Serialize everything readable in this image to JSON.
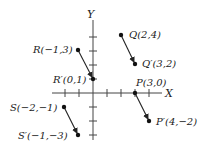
{
  "diagram": {
    "axes": {
      "x_label": "X",
      "y_label": "Y",
      "origin_px": [
        93,
        93
      ],
      "unit_px": 14,
      "x_ticks": [
        -2,
        -1,
        1,
        2,
        3,
        4
      ],
      "y_ticks": [
        -3,
        -2,
        -1,
        1,
        2,
        3
      ]
    },
    "points": [
      {
        "id": "Q",
        "label": "Q(2,4)",
        "x": 2,
        "y": 4
      },
      {
        "id": "Q_prime",
        "label": "Q′(3,2)",
        "x": 3,
        "y": 2
      },
      {
        "id": "R",
        "label": "R(−1,3)",
        "x": -1,
        "y": 3
      },
      {
        "id": "R_prime",
        "label": "R′(0,1)",
        "x": 0,
        "y": 1
      },
      {
        "id": "P",
        "label": "P(3,0)",
        "x": 3,
        "y": 0
      },
      {
        "id": "P_prime",
        "label": "P′(4,−2)",
        "x": 4,
        "y": -2
      },
      {
        "id": "S",
        "label": "S(−2,−1)",
        "x": -2,
        "y": -1
      },
      {
        "id": "S_prime",
        "label": "S′(−1,−3)",
        "x": -1,
        "y": -3
      }
    ],
    "arrows": [
      {
        "from": "Q",
        "to": "Q_prime"
      },
      {
        "from": "R",
        "to": "R_prime"
      },
      {
        "from": "P",
        "to": "P_prime"
      },
      {
        "from": "S",
        "to": "S_prime"
      }
    ],
    "labels": {
      "Q": "Q(2,4)",
      "Q_prime": "Q′(3,2)",
      "R": "R(−1,3)",
      "R_prime": "R′(0,1)",
      "P": "P(3,0)",
      "P_prime": "P′(4,−2)",
      "S": "S(−2,−1)",
      "S_prime": "S′(−1,−3)"
    },
    "colors": {
      "ink": "#222222",
      "background": "#ffffff"
    }
  }
}
